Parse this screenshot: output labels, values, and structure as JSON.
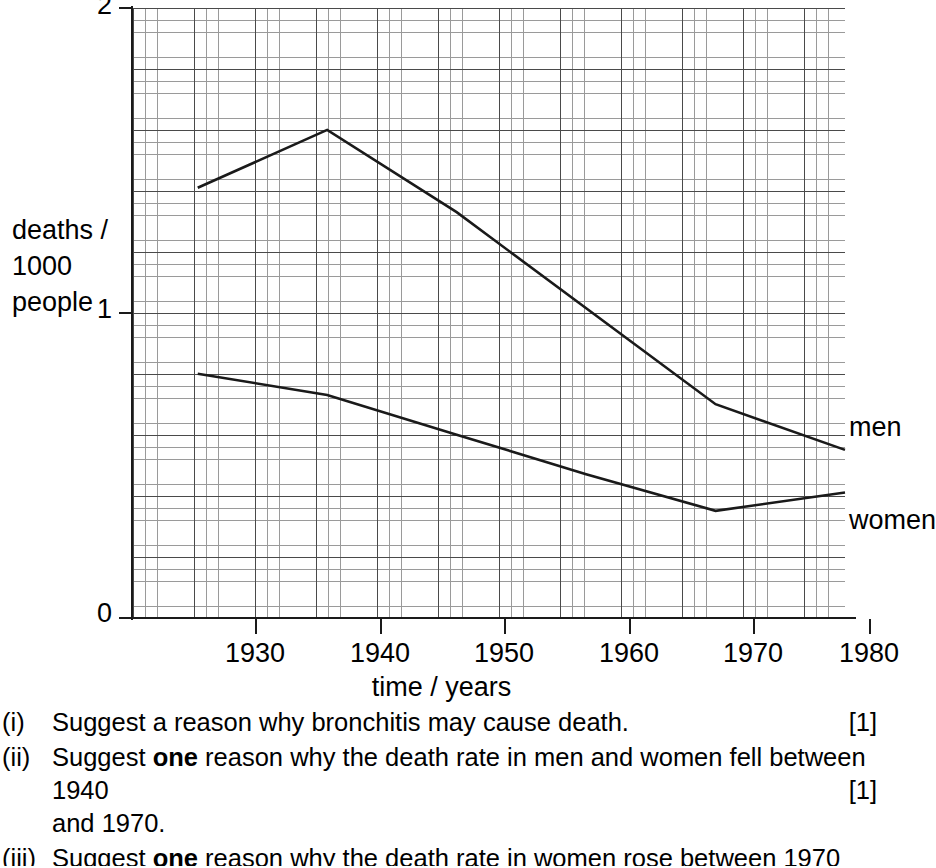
{
  "chart_data": {
    "type": "line",
    "title": "",
    "xlabel": "time / years",
    "ylabel": "deaths / 1000 people",
    "xlim": [
      1925,
      1980
    ],
    "ylim": [
      0,
      2
    ],
    "grid": true,
    "grid_minor_step_x": 1,
    "grid_minor_step_y": 0.04,
    "grid_major_step_x": 5,
    "grid_major_step_y": 0.2,
    "x_ticks": [
      1930,
      1940,
      1950,
      1960,
      1970,
      1980
    ],
    "y_ticks": [
      0,
      1,
      2
    ],
    "legend_position": "right-of-line-ends",
    "series": [
      {
        "name": "men",
        "label": "men",
        "x": [
          1930,
          1940,
          1950,
          1970,
          1980
        ],
        "values": [
          1.41,
          1.6,
          1.33,
          0.7,
          0.55
        ]
      },
      {
        "name": "women",
        "label": "women",
        "x": [
          1930,
          1940,
          1950,
          1960,
          1970,
          1980
        ],
        "values": [
          0.8,
          0.73,
          0.6,
          0.47,
          0.35,
          0.41
        ]
      }
    ]
  },
  "axes": {
    "y_title_text": "deaths /\n1000\npeople",
    "x_title_text": "time / years",
    "y_tick_labels": [
      "0",
      "1",
      "2"
    ],
    "x_tick_labels": [
      "1930",
      "1940",
      "1950",
      "1960",
      "1970",
      "1980"
    ]
  },
  "questions": [
    {
      "marker": "(i)",
      "line1": "Suggest a reason why bronchitis may cause death.",
      "line2": "",
      "marks": "[1]",
      "marks_line": 1
    },
    {
      "marker": "(ii)",
      "line1_pre": "Suggest ",
      "line1_bold": "one",
      "line1_post": " reason why the death rate in men and women fell between 1940",
      "line2": "and 1970.",
      "marks": "[1]",
      "marks_line": 2
    },
    {
      "marker": "(iii)",
      "line1_pre": "Suggest ",
      "line1_bold": "one",
      "line1_post": " reason why the death rate in women rose between 1970 and",
      "line2": "",
      "marks": "",
      "marks_line": 1
    }
  ]
}
